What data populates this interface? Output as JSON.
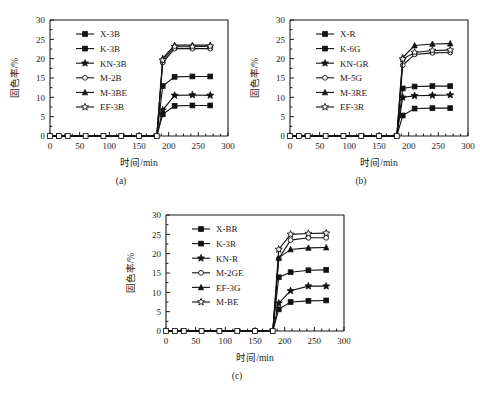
{
  "figure": {
    "background_color": "#ffffff",
    "line_color": "#111111",
    "panel_captions": [
      "(a)",
      "(b)",
      "(c)"
    ]
  },
  "axis": {
    "xlabel": "时间/min",
    "ylabel": "固色率/%",
    "xticks": [
      0,
      50,
      100,
      150,
      200,
      250,
      300
    ],
    "yticks": [
      0,
      5,
      10,
      15,
      20,
      25,
      30
    ],
    "xlim": [
      0,
      300
    ],
    "ylim": [
      0,
      30
    ]
  },
  "chart_data": [
    {
      "type": "line",
      "title": "(a)",
      "xlabel": "时间/min",
      "ylabel": "固色率/%",
      "xlim": [
        0,
        300
      ],
      "ylim": [
        0,
        30
      ],
      "grid": false,
      "legend_position": "upper-left-inside",
      "x": [
        0,
        15,
        30,
        60,
        90,
        120,
        150,
        180,
        190,
        210,
        240,
        270
      ],
      "series": [
        {
          "name": "X-3B",
          "marker": "filled-square",
          "values": [
            0,
            0,
            0,
            0,
            0,
            0,
            0,
            0,
            12.9,
            15.3,
            15.4,
            15.4
          ]
        },
        {
          "name": "K-3B",
          "marker": "filled-square",
          "values": [
            0,
            0,
            0,
            0,
            0,
            0,
            0,
            0,
            5.6,
            7.8,
            7.9,
            7.9
          ]
        },
        {
          "name": "KN-3B",
          "marker": "filled-star",
          "values": [
            0,
            0,
            0,
            0,
            0,
            0,
            0,
            0,
            6.7,
            10.5,
            10.6,
            10.5
          ]
        },
        {
          "name": "M-2B",
          "marker": "open-circle",
          "values": [
            0,
            0,
            0,
            0,
            0,
            0,
            0,
            0,
            19.0,
            22.6,
            22.6,
            22.6
          ]
        },
        {
          "name": "M-3BE",
          "marker": "filled-triangle",
          "values": [
            0,
            0,
            0,
            0,
            0,
            0,
            0,
            0,
            20.1,
            23.5,
            23.5,
            23.5
          ]
        },
        {
          "name": "EF-3B",
          "marker": "open-star",
          "values": [
            0,
            0,
            0,
            0,
            0,
            0,
            0,
            0,
            19.6,
            23.1,
            23.1,
            23.2
          ]
        }
      ]
    },
    {
      "type": "line",
      "title": "(b)",
      "xlabel": "时间/min",
      "ylabel": "固色率/%",
      "xlim": [
        0,
        300
      ],
      "ylim": [
        0,
        30
      ],
      "grid": false,
      "legend_position": "upper-left-inside",
      "x": [
        0,
        15,
        30,
        60,
        90,
        120,
        150,
        180,
        190,
        210,
        240,
        270
      ],
      "series": [
        {
          "name": "X-R",
          "marker": "filled-square",
          "values": [
            0,
            0,
            0,
            0,
            0,
            0,
            0,
            0,
            12.3,
            12.8,
            12.9,
            12.9
          ]
        },
        {
          "name": "K-6G",
          "marker": "filled-square",
          "values": [
            0,
            0,
            0,
            0,
            0,
            0,
            0,
            0,
            5.3,
            7.1,
            7.2,
            7.2
          ]
        },
        {
          "name": "KN-GR",
          "marker": "filled-star",
          "values": [
            0,
            0,
            0,
            0,
            0,
            0,
            0,
            0,
            10.0,
            10.4,
            10.5,
            10.6
          ]
        },
        {
          "name": "M-5G",
          "marker": "open-circle",
          "values": [
            0,
            0,
            0,
            0,
            0,
            0,
            0,
            0,
            18.3,
            21.1,
            21.5,
            21.6
          ]
        },
        {
          "name": "M-3RE",
          "marker": "filled-triangle",
          "values": [
            0,
            0,
            0,
            0,
            0,
            0,
            0,
            0,
            20.3,
            23.4,
            23.8,
            23.9
          ]
        },
        {
          "name": "EF-3R",
          "marker": "open-star",
          "values": [
            0,
            0,
            0,
            0,
            0,
            0,
            0,
            0,
            19.9,
            21.6,
            22.1,
            22.2
          ]
        }
      ]
    },
    {
      "type": "line",
      "title": "(c)",
      "xlabel": "时间/min",
      "ylabel": "固色率/%",
      "xlim": [
        0,
        300
      ],
      "ylim": [
        0,
        30
      ],
      "grid": false,
      "legend_position": "upper-left-inside",
      "x": [
        0,
        15,
        30,
        60,
        90,
        120,
        150,
        180,
        190,
        210,
        240,
        270
      ],
      "series": [
        {
          "name": "X-BR",
          "marker": "filled-square",
          "values": [
            0,
            0,
            0,
            0,
            0,
            0,
            0,
            0,
            13.9,
            15.2,
            15.7,
            15.8
          ]
        },
        {
          "name": "K-3R",
          "marker": "filled-square",
          "values": [
            0,
            0,
            0,
            0,
            0,
            0,
            0,
            0,
            5.6,
            7.5,
            7.8,
            7.9
          ]
        },
        {
          "name": "KN-R",
          "marker": "filled-star",
          "values": [
            0,
            0,
            0,
            0,
            0,
            0,
            0,
            0,
            7.2,
            10.4,
            11.6,
            11.6
          ]
        },
        {
          "name": "M-2GE",
          "marker": "open-circle",
          "values": [
            0,
            0,
            0,
            0,
            0,
            0,
            0,
            0,
            18.7,
            23.5,
            24.1,
            24.1
          ]
        },
        {
          "name": "EF-3G",
          "marker": "filled-triangle",
          "values": [
            0,
            0,
            0,
            0,
            0,
            0,
            0,
            0,
            18.9,
            21.1,
            21.5,
            21.6
          ]
        },
        {
          "name": "M-BE",
          "marker": "open-star",
          "values": [
            0,
            0,
            0,
            0,
            0,
            0,
            0,
            0,
            21.1,
            25.0,
            25.2,
            25.3
          ]
        }
      ]
    }
  ]
}
